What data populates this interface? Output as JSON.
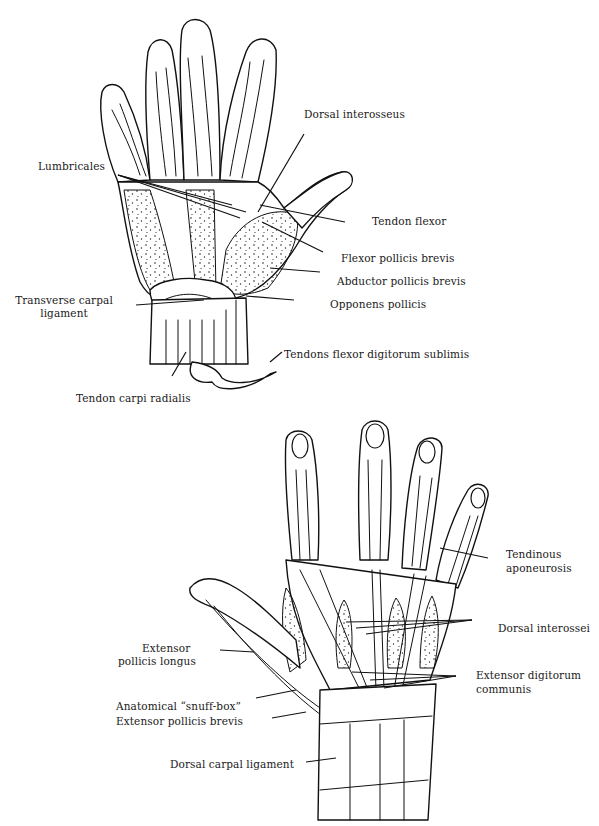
{
  "diagram": {
    "palmar_view": {
      "labels": [
        {
          "id": "lumbricales",
          "text": "Lumbricales"
        },
        {
          "id": "dorsal-interosseus",
          "text": "Dorsal   interosseus"
        },
        {
          "id": "tendon-flexor",
          "text": "Tendon flexor"
        },
        {
          "id": "flexor-pollicis-brevis",
          "text": "Flexor pollicis brevis"
        },
        {
          "id": "abductor-pollicis-brevis",
          "text": "Abductor pollicis brevis"
        },
        {
          "id": "opponens-pollicis",
          "text": "Opponens pollicis"
        },
        {
          "id": "transverse-carpal-ligament-1",
          "text": "Transverse carpal"
        },
        {
          "id": "transverse-carpal-ligament-2",
          "text": "ligament"
        },
        {
          "id": "tendons-flexor-digitorum-sublimis",
          "text": "Tendons flexor digitorum sublimis"
        },
        {
          "id": "tendon-carpi-radialis",
          "text": "Tendon carpi radialis"
        }
      ]
    },
    "dorsal_view": {
      "labels": [
        {
          "id": "tendinous-aponeurosis-1",
          "text": "Tendinous"
        },
        {
          "id": "tendinous-aponeurosis-2",
          "text": "aponeurosis"
        },
        {
          "id": "dorsal-interossei",
          "text": "Dorsal interossei"
        },
        {
          "id": "extensor-digitorum-communis-1",
          "text": "Extensor digitorum"
        },
        {
          "id": "extensor-digitorum-communis-2",
          "text": "communis"
        },
        {
          "id": "extensor-pollicis-longus-1",
          "text": "Extensor"
        },
        {
          "id": "extensor-pollicis-longus-2",
          "text": "pollicis longus"
        },
        {
          "id": "anatomical-snuff-box",
          "text": "Anatomical “snuff-box”"
        },
        {
          "id": "extensor-pollicis-brevis",
          "text": "Extensor pollicis brevis"
        },
        {
          "id": "dorsal-carpal-ligament",
          "text": "Dorsal carpal ligament"
        }
      ]
    }
  }
}
